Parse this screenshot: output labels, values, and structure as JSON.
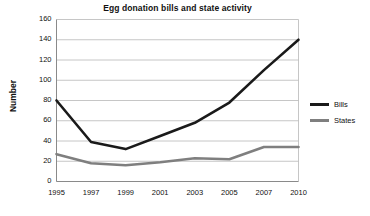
{
  "chart_data": {
    "type": "line",
    "title": "Egg donation bills and state activity",
    "xlabel": "",
    "ylabel": "Number",
    "categories": [
      "1995",
      "1997",
      "1999",
      "2001",
      "2003",
      "2005",
      "2007",
      "2010"
    ],
    "series": [
      {
        "name": "Bills",
        "color": "#1a1a1a",
        "values": [
          80,
          39,
          32,
          45,
          58,
          78,
          110,
          140
        ]
      },
      {
        "name": "States",
        "color": "#7f7f7f",
        "values": [
          27,
          18,
          16,
          19,
          23,
          22,
          34,
          34
        ]
      }
    ],
    "ylim": [
      0,
      160
    ],
    "ytick_step": 20,
    "ytick_labels": [
      "160",
      "140",
      "120",
      "100",
      "80",
      "60",
      "40",
      "20",
      "0"
    ],
    "grid": true,
    "grid_orientation": "horizontal",
    "legend_position": "right"
  },
  "legend": {
    "items": [
      {
        "label": "Bills"
      },
      {
        "label": "States"
      }
    ]
  },
  "colors": {
    "bills": "#1a1a1a",
    "states": "#7f7f7f",
    "grid": "#b8b8b8",
    "axis": "#8a8a8a",
    "text": "#111111"
  }
}
